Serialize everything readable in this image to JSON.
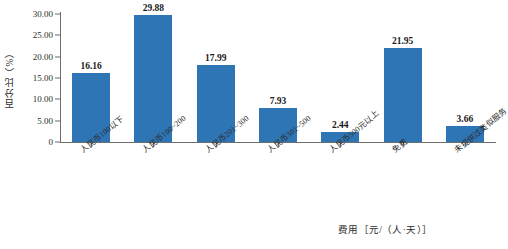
{
  "chart_data": {
    "type": "bar",
    "title": "",
    "xlabel": "费用［元/（人·天）］",
    "ylabel": "百分比（%）",
    "ylim": [
      0,
      30
    ],
    "grid": false,
    "legend": "none",
    "categories": [
      "人民币100以下",
      "人民币100~200",
      "人民币201~300",
      "人民币301~500",
      "人民币500元以上",
      "免费",
      "未提供过类似服务"
    ],
    "values": [
      16.16,
      29.88,
      17.99,
      7.93,
      2.44,
      21.95,
      3.66
    ],
    "value_labels": [
      "16.16",
      "29.88",
      "17.99",
      "7.93",
      "2.44",
      "21.95",
      "3.66"
    ],
    "y_ticks": [
      {
        "value": 30,
        "label": "30.00"
      },
      {
        "value": 25,
        "label": "25.00"
      },
      {
        "value": 20,
        "label": "20.00"
      },
      {
        "value": 15,
        "label": "15.00"
      },
      {
        "value": 10,
        "label": "10.00"
      },
      {
        "value": 5,
        "label": "5.00"
      },
      {
        "value": 0,
        "label": "0"
      }
    ],
    "series_color": "#2e75b6",
    "axis_color": "#6d6d6d"
  }
}
